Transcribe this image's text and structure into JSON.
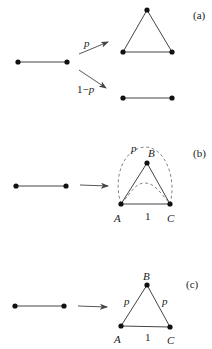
{
  "colors": {
    "stroke": "#444444",
    "node": "#111111",
    "text": "#222222"
  },
  "panels": [
    {
      "id": "a",
      "label": "(a)",
      "branch_upper_label": "p",
      "branch_lower_label": "1−p"
    },
    {
      "id": "b",
      "label": "(b)",
      "node_labels": {
        "A": "A",
        "B": "B",
        "C": "C"
      },
      "edge_label_AC": "1",
      "dashed_label": "p"
    },
    {
      "id": "c",
      "label": "(c)",
      "node_labels": {
        "A": "A",
        "B": "B",
        "C": "C"
      },
      "edge_label_AC": "1",
      "edge_label_AB": "p",
      "edge_label_BC": "p"
    }
  ]
}
